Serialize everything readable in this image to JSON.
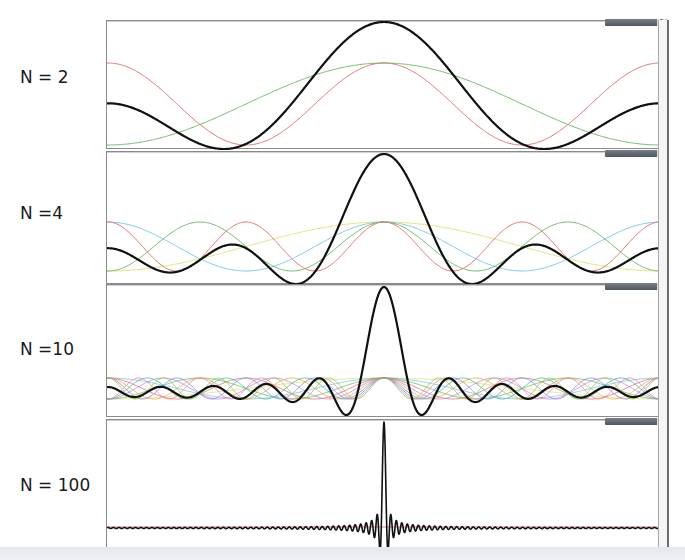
{
  "figure": {
    "panels": [
      {
        "label": "N = 2"
      },
      {
        "label": "N =4"
      },
      {
        "label": "N =10"
      },
      {
        "label": "N = 100"
      }
    ],
    "toolbar": {
      "chevron": "^"
    }
  },
  "chart_data": {
    "type": "line",
    "title": "",
    "xlabel": "",
    "ylabel": "",
    "grid": false,
    "legend": null,
    "colors": {
      "sum": "#111111",
      "components_N2": [
        "#5cb85c",
        "#e06666"
      ],
      "components_N4": [
        "#d9e36b",
        "#6fc3e8",
        "#5cb85c",
        "#e06666"
      ],
      "components_N10_palette": [
        "#d9e36b",
        "#6fc3e8",
        "#5cb85c",
        "#e06666",
        "#c080d0",
        "#f0a040",
        "#40b0a0",
        "#8080e0",
        "#e080a0",
        "#90c040"
      ]
    },
    "panels": [
      {
        "N": 2,
        "label": "N = 2",
        "top": 20,
        "height": 127,
        "sum_peak_y": 21,
        "sum_min_y": 148,
        "comp_top_y": 62,
        "comp_bot_y": 144,
        "x_range": [
          -1,
          1
        ],
        "center_x": 383
      },
      {
        "N": 4,
        "label": "N =4",
        "top": 151,
        "height": 131,
        "sum_peak_y": 153,
        "sum_min_y": 283,
        "comp_top_y": 221,
        "comp_bot_y": 270,
        "x_range": [
          -1,
          1
        ],
        "center_x": 383
      },
      {
        "N": 10,
        "label": "N =10",
        "top": 284,
        "height": 131,
        "sum_peak_y": 286,
        "sum_min_y": 414,
        "comp_top_y": 377,
        "comp_bot_y": 398,
        "x_range": [
          -1,
          1
        ],
        "center_x": 383
      },
      {
        "N": 100,
        "label": "N = 100",
        "top": 419,
        "height": 128,
        "sum_peak_y": 421,
        "sum_min_y": 550,
        "comp_top_y": 524,
        "comp_bot_y": 528,
        "x_range": [
          -1,
          1
        ],
        "center_x": 383
      }
    ]
  }
}
